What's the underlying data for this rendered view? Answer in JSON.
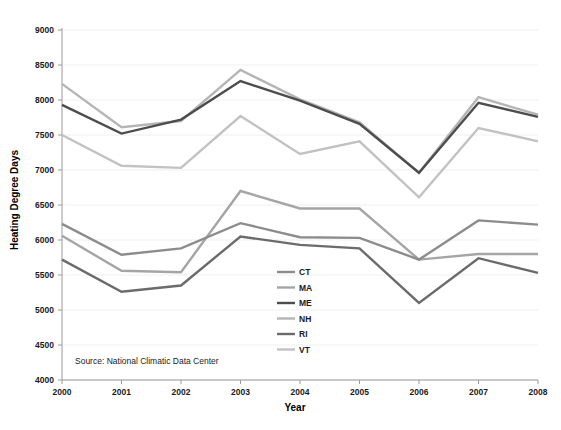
{
  "chart_data": {
    "type": "line",
    "title": "",
    "xlabel": "Year",
    "ylabel": "Heating Degree Days",
    "categories": [
      "2000",
      "2001",
      "2002",
      "2003",
      "2004",
      "2005",
      "2006",
      "2007",
      "2008"
    ],
    "x": [
      2000,
      2001,
      2002,
      2003,
      2004,
      2005,
      2006,
      2007,
      2008
    ],
    "xlim": [
      2000,
      2008
    ],
    "ylim": [
      4000,
      9000
    ],
    "yticks": [
      4000,
      4500,
      5000,
      5500,
      6000,
      6500,
      7000,
      7500,
      8000,
      8500,
      9000
    ],
    "ytick_labels": [
      "4000",
      "4500",
      "5000",
      "5500",
      "6000",
      "6500",
      "7000",
      "7500",
      "8000",
      "8500",
      "9000"
    ],
    "grid": true,
    "grid_axis": "y",
    "legend_position": "center",
    "series": [
      {
        "name": "CT",
        "color": "#8c8c8c",
        "values": [
          6230,
          5790,
          5880,
          6240,
          6040,
          6030,
          5720,
          6280,
          6220
        ]
      },
      {
        "name": "MA",
        "color": "#a5a5a5",
        "values": [
          6060,
          5560,
          5540,
          6700,
          6450,
          6450,
          5720,
          5800,
          5800
        ]
      },
      {
        "name": "ME",
        "color": "#4d4d4d",
        "values": [
          7930,
          7520,
          7720,
          8270,
          7990,
          7660,
          6960,
          7960,
          7760
        ]
      },
      {
        "name": "NH",
        "color": "#b5b5b5",
        "values": [
          8230,
          7610,
          7700,
          8430,
          8010,
          7680,
          6960,
          8040,
          7790
        ]
      },
      {
        "name": "RI",
        "color": "#6b6b6b",
        "values": [
          5720,
          5260,
          5350,
          6050,
          5930,
          5880,
          5100,
          5740,
          5530
        ]
      },
      {
        "name": "VT",
        "color": "#c2c2c2",
        "values": [
          7500,
          7060,
          7030,
          7770,
          7230,
          7410,
          6610,
          7600,
          7410
        ]
      }
    ],
    "annotations": [
      {
        "name": "source-note",
        "text": "Source: National Climatic Data Center"
      }
    ]
  },
  "legend": {
    "entries": [
      {
        "label": "CT"
      },
      {
        "label": "MA"
      },
      {
        "label": "ME"
      },
      {
        "label": "NH"
      },
      {
        "label": "RI"
      },
      {
        "label": "VT"
      }
    ]
  },
  "axes": {
    "x_title": "Year",
    "y_title": "Heating Degree Days"
  },
  "source": {
    "text": "Source: National Climatic Data Center"
  }
}
